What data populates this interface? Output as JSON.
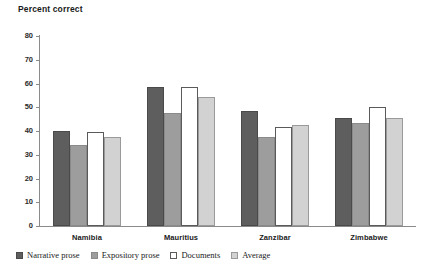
{
  "chart_data": {
    "type": "bar",
    "title": "Percent correct",
    "xlabel": "",
    "ylabel": "",
    "ylim": [
      0,
      80
    ],
    "yticks": [
      0,
      10,
      20,
      30,
      40,
      50,
      60,
      70,
      80
    ],
    "ytick_labels": [
      "0",
      "10",
      "20",
      "30",
      "40",
      "50",
      "60",
      "70",
      "80"
    ],
    "grid": false,
    "legend_position": "bottom",
    "categories": [
      "Namibia",
      "Mauritius",
      "Zanzibar",
      "Zimbabwe"
    ],
    "series": [
      {
        "name": "Narrative prose",
        "color": "#5e5e5e",
        "values": [
          40.0,
          58.5,
          48.5,
          45.5
        ]
      },
      {
        "name": "Expository prose",
        "color": "#9d9d9d",
        "values": [
          34.0,
          47.5,
          37.5,
          43.5
        ]
      },
      {
        "name": "Documents",
        "color": "#ffffff",
        "values": [
          39.5,
          58.5,
          41.5,
          50.0
        ]
      },
      {
        "name": "Average",
        "color": "#d2d2d2",
        "values": [
          37.5,
          54.5,
          42.5,
          45.5
        ]
      }
    ]
  }
}
